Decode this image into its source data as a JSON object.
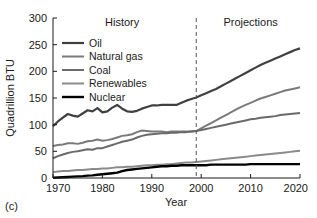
{
  "panel": {
    "label": "(c)"
  },
  "chart_data": {
    "type": "line",
    "title": "",
    "xlabel": "Year",
    "ylabel": "Quadrillion BTU",
    "xlim": [
      1970,
      2020
    ],
    "ylim": [
      0,
      300
    ],
    "xticks": [
      1970,
      1980,
      1990,
      2000,
      2010,
      2020
    ],
    "yticks": [
      0,
      50,
      100,
      150,
      200,
      250,
      300
    ],
    "grid": false,
    "legend_position": "upper-left",
    "annotations": [
      {
        "text": "History",
        "x": 1984,
        "y": 285
      },
      {
        "text": "Projections",
        "x": 2010,
        "y": 285
      }
    ],
    "divider": {
      "x": 1999,
      "style": "dashed"
    },
    "x": [
      1970,
      1971,
      1972,
      1973,
      1974,
      1975,
      1976,
      1977,
      1978,
      1979,
      1980,
      1981,
      1982,
      1983,
      1984,
      1985,
      1986,
      1987,
      1988,
      1989,
      1990,
      1991,
      1992,
      1993,
      1994,
      1995,
      1996,
      1997,
      1998,
      1999,
      2000,
      2001,
      2002,
      2003,
      2004,
      2005,
      2006,
      2007,
      2008,
      2009,
      2010,
      2011,
      2012,
      2013,
      2014,
      2015,
      2016,
      2017,
      2018,
      2019,
      2020
    ],
    "series": [
      {
        "name": "Oil",
        "color": "#404040",
        "width": 2.2,
        "values": [
          97,
          106,
          113,
          120,
          117,
          115,
          121,
          127,
          125,
          131,
          123,
          125,
          132,
          137,
          130,
          125,
          124,
          126,
          130,
          133,
          136,
          136,
          137,
          137,
          137,
          137,
          141,
          145,
          148,
          151,
          155,
          159,
          163,
          167,
          172,
          177,
          182,
          187,
          192,
          197,
          202,
          207,
          212,
          216,
          220,
          224,
          228,
          232,
          236,
          240,
          243
        ]
      },
      {
        "name": "Natural gas",
        "color": "#7a7a7a",
        "width": 2.0,
        "values": [
          60,
          62,
          63,
          65,
          65,
          64,
          66,
          69,
          70,
          72,
          70,
          71,
          73,
          76,
          79,
          80,
          82,
          86,
          89,
          88,
          87,
          87,
          87,
          86,
          87,
          87,
          87,
          87,
          87,
          88,
          93,
          98,
          103,
          108,
          113,
          118,
          123,
          128,
          133,
          137,
          141,
          145,
          149,
          152,
          155,
          158,
          161,
          164,
          166,
          168,
          170
        ]
      },
      {
        "name": "Coal",
        "color": "#6a6a6a",
        "width": 2.0,
        "values": [
          37,
          41,
          44,
          47,
          49,
          50,
          52,
          54,
          53,
          56,
          56,
          59,
          62,
          65,
          68,
          70,
          72,
          76,
          79,
          81,
          82,
          83,
          84,
          84,
          85,
          85,
          86,
          86,
          87,
          88,
          90,
          92,
          94,
          96,
          98,
          100,
          102,
          104,
          106,
          108,
          110,
          111,
          113,
          114,
          115,
          116,
          118,
          119,
          120,
          121,
          122
        ]
      },
      {
        "name": "Renewables",
        "color": "#8a8a8a",
        "width": 2.0,
        "values": [
          11,
          12,
          13,
          13,
          14,
          15,
          15,
          16,
          17,
          17,
          18,
          18,
          19,
          20,
          20,
          21,
          21,
          22,
          23,
          24,
          24,
          25,
          25,
          26,
          26,
          27,
          28,
          29,
          29,
          30,
          31,
          32,
          33,
          34,
          35,
          36,
          37,
          38,
          39,
          40,
          41,
          42,
          43,
          44,
          45,
          46,
          47,
          48,
          49,
          50,
          51
        ]
      },
      {
        "name": "Nuclear",
        "color": "#000000",
        "width": 2.4,
        "values": [
          0.5,
          1,
          1.5,
          2,
          2.5,
          3,
          3.5,
          4.5,
          5,
          6,
          7,
          8,
          9,
          10,
          13,
          15,
          16,
          17,
          18,
          19,
          20,
          21,
          22,
          22,
          23,
          23,
          24,
          24,
          24,
          24,
          24,
          24,
          25,
          25,
          25,
          25,
          25,
          25,
          25,
          25,
          26,
          26,
          26,
          26,
          26,
          26,
          26,
          26,
          26,
          26,
          26
        ]
      }
    ]
  }
}
